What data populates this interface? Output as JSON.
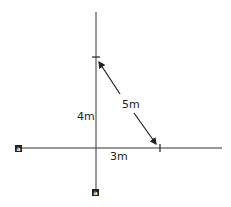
{
  "diagram": {
    "labels": {
      "vertical": "4m",
      "horizontal": "3m",
      "hypotenuse": "5m"
    },
    "markers": {
      "left_end": "a",
      "bottom_end": "a"
    },
    "colors": {
      "ink": "#222222",
      "background": "#ffffff"
    }
  }
}
